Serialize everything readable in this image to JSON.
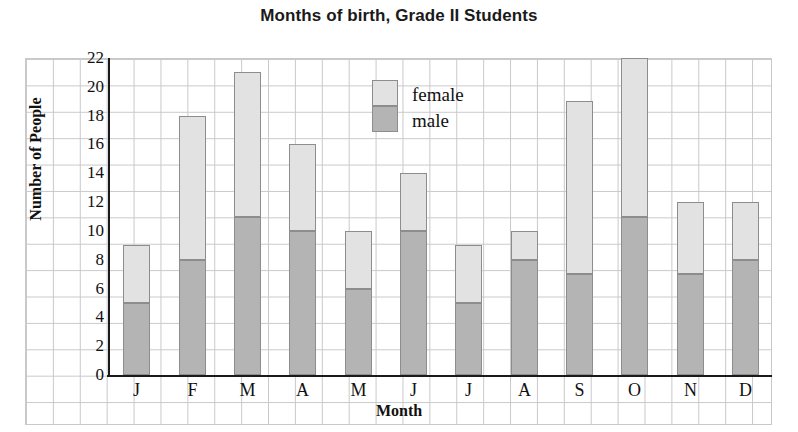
{
  "chart_data": {
    "type": "bar",
    "subtype": "stacked-vertical",
    "title": "Months of birth, Grade II Students",
    "xlabel": "Month",
    "ylabel": "Number of People",
    "categories": [
      "J",
      "F",
      "M",
      "A",
      "M",
      "J",
      "J",
      "A",
      "S",
      "O",
      "N",
      "D"
    ],
    "series": [
      {
        "name": "male",
        "color": "#b4b4b4",
        "values": [
          5,
          8,
          11,
          10,
          6,
          10,
          5,
          8,
          7,
          11,
          7,
          8
        ]
      },
      {
        "name": "female",
        "color": "#e2e2e2",
        "values": [
          4,
          10,
          10,
          6,
          4,
          4,
          4,
          2,
          12,
          11,
          5,
          4
        ]
      }
    ],
    "totals": [
      9,
      18,
      21,
      16,
      10,
      14,
      9,
      10,
      19,
      22,
      12,
      12
    ],
    "ylim": [
      0,
      22
    ],
    "ytick_values": [
      0,
      2,
      4,
      6,
      8,
      10,
      12,
      14,
      16,
      18,
      20,
      22
    ],
    "ytick_labels": [
      "0",
      "2",
      "4",
      "6",
      "8",
      "10",
      "12",
      "14",
      "16",
      "18",
      "20",
      "22"
    ],
    "grid": true,
    "grid_style": "graph-paper",
    "legend_position": "inside-top-center",
    "legend_entries": [
      {
        "label": "female",
        "color": "#e2e2e2"
      },
      {
        "label": "male",
        "color": "#b4b4b4"
      }
    ]
  },
  "colors": {
    "male": "#b4b4b4",
    "female": "#e2e2e2",
    "grid": "#c9c9cd",
    "axis": "#1a1a1a",
    "text": "#111111",
    "background": "#ffffff"
  }
}
